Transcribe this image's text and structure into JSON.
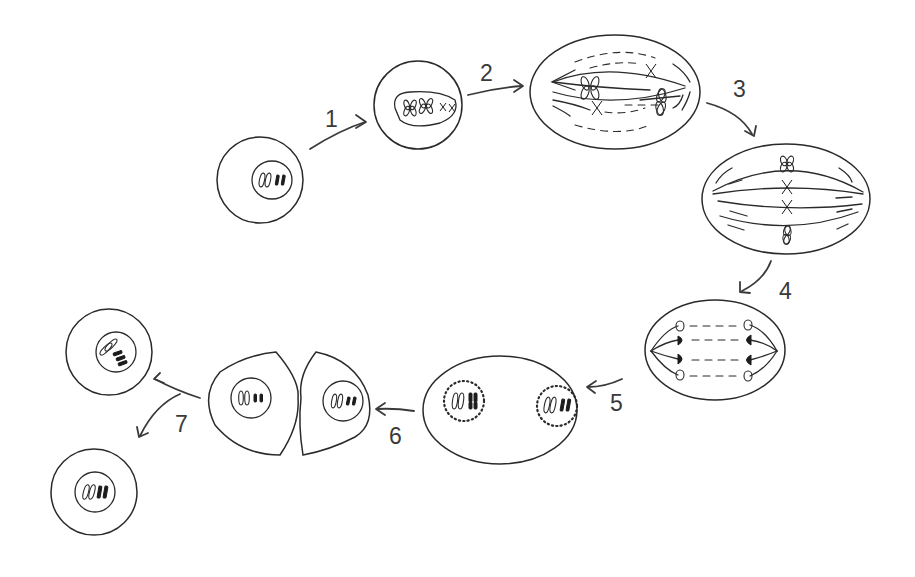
{
  "diagram": {
    "title": "",
    "type": "cell cycle / mitosis sequence",
    "colors": {
      "line": "#2a2a2a",
      "label": "#3a3a3a",
      "background": "#ffffff"
    },
    "steps": [
      {
        "label": "1",
        "from": "interphase cell",
        "to": "prophase cell"
      },
      {
        "label": "2",
        "from": "prophase cell",
        "to": "prometaphase cell"
      },
      {
        "label": "3",
        "from": "prometaphase cell",
        "to": "metaphase cell"
      },
      {
        "label": "4",
        "from": "metaphase cell",
        "to": "anaphase cell"
      },
      {
        "label": "5",
        "from": "anaphase cell",
        "to": "telophase cell"
      },
      {
        "label": "6",
        "from": "telophase cell",
        "to": "cytokinesis cells"
      },
      {
        "label": "7",
        "from": "cytokinesis cells",
        "to": "two daughter cells"
      }
    ],
    "stages": [
      {
        "id": "interphase",
        "description": "Round cell with nucleus containing 2 open and 2 filled chromosomes"
      },
      {
        "id": "prophase",
        "description": "Round cell with oval nucleus containing condensed X-shaped chromosomes"
      },
      {
        "id": "prometaphase",
        "description": "Oval cell with spindle fibers and scattered X-shaped chromosomes"
      },
      {
        "id": "metaphase",
        "description": "Oval cell with 4 chromosomes aligned at the equator"
      },
      {
        "id": "anaphase",
        "description": "Oval cell with sister chromatids pulled to opposite poles"
      },
      {
        "id": "telophase",
        "description": "Oval cell with two reforming dotted nuclear envelopes"
      },
      {
        "id": "cytokinesis",
        "description": "Two joined cells pinching apart, each with a nucleus"
      },
      {
        "id": "daughter-cells",
        "description": "Two separate round daughter cells"
      }
    ]
  }
}
